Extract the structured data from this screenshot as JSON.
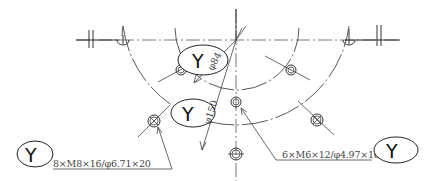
{
  "drawing": {
    "title": "Flange bolt hole pattern (section view)",
    "stroke_color": "#333333",
    "background": "#ffffff",
    "labels": {
      "bubble_symbol": "Y",
      "dim_inner_diameter": "φ84",
      "dim_outer_diameter": "φ150",
      "callout_left": "8×M8×16/φ6.71×20",
      "callout_right": "6×M6×12/φ4.97×16"
    },
    "bubbles": [
      {
        "id": "bubble-inner-dia",
        "label": "Y"
      },
      {
        "id": "bubble-outer-dia",
        "label": "Y"
      },
      {
        "id": "bubble-left-callout",
        "label": "Y"
      },
      {
        "id": "bubble-right-callout",
        "label": "Y"
      }
    ],
    "hole_patterns": [
      {
        "count": 8,
        "thread": "M8",
        "thread_depth": 16,
        "drill_dia": 6.71,
        "drill_depth": 20,
        "pcd": 150
      },
      {
        "count": 6,
        "thread": "M6",
        "thread_depth": 12,
        "drill_dia": 4.97,
        "drill_depth": 16,
        "pcd": 84
      }
    ]
  }
}
